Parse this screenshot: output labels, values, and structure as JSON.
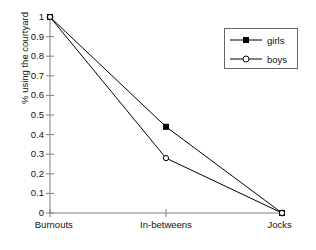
{
  "chart_data": {
    "type": "line",
    "title": "",
    "subtitle": "",
    "xlabel": "",
    "ylabel": "% using the courtyard",
    "categories": [
      "Burnouts",
      "In-betweens",
      "Jocks"
    ],
    "series": [
      {
        "name": "girls",
        "values": [
          1,
          0.44,
          0
        ],
        "marker": "filled-square",
        "color": "#000000"
      },
      {
        "name": "boys",
        "values": [
          1,
          0.28,
          0
        ],
        "marker": "open-circle",
        "color": "#000000"
      }
    ],
    "ylim": [
      0,
      1
    ],
    "ytick_labels": [
      "1",
      "0.9",
      "0.8",
      "0.7",
      "0.6",
      "0.5",
      "0.4",
      "0.3",
      "0.2",
      "0.1",
      "0"
    ],
    "ytick_values": [
      1,
      0.9,
      0.8,
      0.7,
      0.6,
      0.5,
      0.4,
      0.3,
      0.2,
      0.1,
      0
    ],
    "grid": false,
    "legend_position": "top-right",
    "legend_entries": [
      "girls",
      "boys"
    ],
    "axis_color": "#808080"
  },
  "legend": {
    "girls_label": "girls",
    "boys_label": "boys"
  },
  "axes": {
    "y_title": "% using the courtyard"
  }
}
